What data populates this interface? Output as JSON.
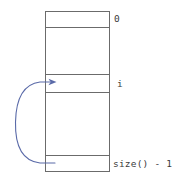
{
  "figure": {
    "background_color": "#ffffff"
  },
  "array_box": {
    "name": "array-box",
    "outline_color": "#6b6b6b",
    "fill_color": "#ffffff",
    "left": 45,
    "right": 110,
    "top": 11,
    "bottom": 172,
    "divider_color": "#6b6b6b",
    "divider_y_positions": [
      11,
      27,
      74,
      92,
      155,
      172
    ],
    "cells": [
      {
        "index": 0,
        "label": "0",
        "top": 11,
        "bottom": 27,
        "has_label": true
      },
      {
        "index": 1,
        "label": "",
        "top": 27,
        "bottom": 74,
        "has_label": false
      },
      {
        "index": 2,
        "label": "i",
        "top": 74,
        "bottom": 92,
        "has_label": true
      },
      {
        "index": 3,
        "label": "",
        "top": 92,
        "bottom": 155,
        "has_label": false
      },
      {
        "index": 4,
        "label": "size() - 1",
        "top": 155,
        "bottom": 172,
        "has_label": true
      }
    ]
  },
  "labels": {
    "first_index": "0",
    "current_index": "i",
    "last_index": "size() - 1",
    "text_color": "#3b3b3b"
  },
  "arrow": {
    "name": "curved-back-arrow",
    "color": "#5a6aa8",
    "stroke_width": 1,
    "from_cell_label": "size() - 1",
    "to_cell_label": "i",
    "tail_point": {
      "x": 55,
      "y": 163
    },
    "leftmost_point": {
      "x": 16,
      "y": 122
    },
    "head_point": {
      "x": 55,
      "y": 82
    },
    "head_direction": "right"
  }
}
